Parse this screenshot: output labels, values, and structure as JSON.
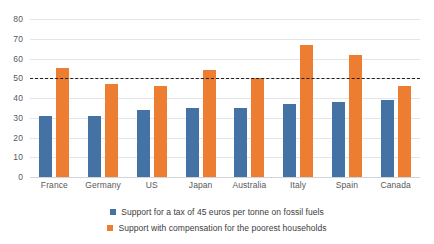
{
  "chart_data": {
    "type": "bar",
    "title": "",
    "subtitle": "",
    "xlabel": "",
    "ylabel": "",
    "ylim": [
      0,
      80
    ],
    "yticks": [
      0,
      10,
      20,
      30,
      40,
      50,
      60,
      70,
      80
    ],
    "grid": true,
    "legend_position": "bottom",
    "categories": [
      "France",
      "Germany",
      "US",
      "Japan",
      "Australia",
      "Italy",
      "Spain",
      "Canada"
    ],
    "series": [
      {
        "name": "Support for a tax of 45 euros per tonne on fossil fuels",
        "color": "#4472A4",
        "values": [
          31,
          31,
          34,
          35,
          35,
          37,
          38,
          39
        ]
      },
      {
        "name": "Support with compensation for the poorest households",
        "color": "#ED7D31",
        "values": [
          55,
          47,
          46,
          54,
          50,
          67,
          62,
          46
        ]
      }
    ],
    "annotations": [
      {
        "type": "reference-line",
        "name": "fifty-percent-threshold",
        "orientation": "horizontal",
        "value": 50,
        "style": "dashed",
        "color": "#1F1F1F"
      }
    ]
  },
  "axes": {
    "y_tick_labels": [
      "80",
      "70",
      "60",
      "50",
      "40",
      "30",
      "20",
      "10",
      "0"
    ]
  },
  "colors": {
    "series_blue": "#4472A4",
    "series_orange": "#ED7D31",
    "gridline": "#E2E6EA",
    "threshold": "#1F1F1F",
    "tick_text": "#58595B",
    "legend_text": "#3C3C3C",
    "background": "#FFFFFF"
  }
}
